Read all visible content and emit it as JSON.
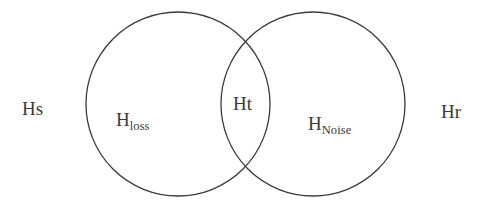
{
  "diagram": {
    "type": "venn-2-set",
    "background_color": "#ffffff",
    "stroke_color": "#3a3a3a",
    "stroke_width": 1.3,
    "text_color": "#3b3b3b",
    "canvas": {
      "width": 486,
      "height": 215
    },
    "circles": [
      {
        "id": "left",
        "name": "H-loss-circle",
        "cx": 178,
        "cy": 104,
        "r": 92
      },
      {
        "id": "right",
        "name": "H-noise-circle",
        "cx": 313,
        "cy": 104,
        "r": 92
      }
    ],
    "labels": {
      "outside_left": "Hs",
      "outside_right": "Hr",
      "left_set_base": "H",
      "left_set_sub": "loss",
      "intersection": "Ht",
      "right_set_base": "H",
      "right_set_sub": "Noise"
    }
  }
}
